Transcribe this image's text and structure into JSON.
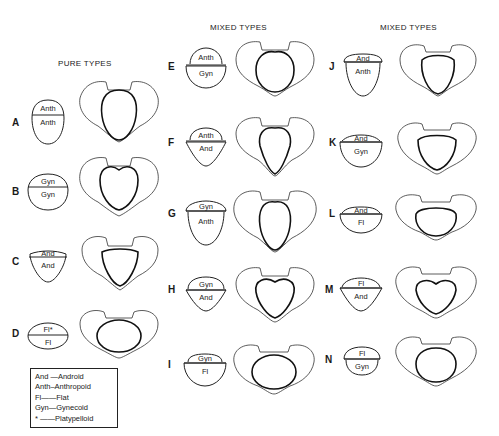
{
  "headers": {
    "pure": "PURE TYPES",
    "mixed_1": "MIXED TYPES",
    "mixed_2": "MIXED TYPES"
  },
  "types": [
    {
      "id": "A",
      "top": "Anth",
      "bottom": "Anth",
      "group": "pure"
    },
    {
      "id": "B",
      "top": "Gyn",
      "bottom": "Gyn",
      "group": "pure"
    },
    {
      "id": "C",
      "top": "And",
      "bottom": "And",
      "group": "pure"
    },
    {
      "id": "D",
      "top": "Fl*",
      "bottom": "Fl",
      "group": "pure"
    },
    {
      "id": "E",
      "top": "Anth",
      "bottom": "Gyn",
      "group": "mixed"
    },
    {
      "id": "F",
      "top": "Anth",
      "bottom": "And",
      "group": "mixed"
    },
    {
      "id": "G",
      "top": "Gyn",
      "bottom": "Anth",
      "group": "mixed"
    },
    {
      "id": "H",
      "top": "Gyn",
      "bottom": "And",
      "group": "mixed"
    },
    {
      "id": "I",
      "top": "Gyn",
      "bottom": "Fl",
      "group": "mixed"
    },
    {
      "id": "J",
      "top": "And",
      "bottom": "Anth",
      "group": "mixed"
    },
    {
      "id": "K",
      "top": "And",
      "bottom": "Gyn",
      "group": "mixed"
    },
    {
      "id": "L",
      "top": "And",
      "bottom": "Fl",
      "group": "mixed"
    },
    {
      "id": "M",
      "top": "Fl",
      "bottom": "And",
      "group": "mixed"
    },
    {
      "id": "N",
      "top": "Fl",
      "bottom": "Gyn",
      "group": "mixed"
    }
  ],
  "legend": [
    "And —Android",
    "Anth–Anthropoid",
    "Fl——Flat",
    "Gyn—Gynecoid",
    "*  ——Platypelloid"
  ]
}
